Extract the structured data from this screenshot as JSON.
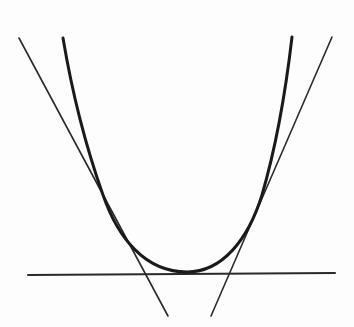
{
  "figure": {
    "description": "Convex curve with three tangent lines: one horizontal tangent at the minimum and one tangent on each side",
    "colors": {
      "background": "#fdfdfd",
      "curve": "#1a1a1a",
      "tangent": "#2a2a2a"
    },
    "curve": {
      "name": "convex-curve",
      "stroke_width": 3,
      "path": "M 63 38 C 70 80, 80 130, 103 195 C 118 238, 145 272, 187 272 C 222 272, 248 240, 262 195 C 278 140, 287 80, 292 37"
    },
    "tangents": [
      {
        "name": "left-tangent-line",
        "x1": 19,
        "y1": 38,
        "x2": 168,
        "y2": 316,
        "stroke_width": 1.6
      },
      {
        "name": "right-tangent-line",
        "x1": 332,
        "y1": 37,
        "x2": 211,
        "y2": 316,
        "stroke_width": 1.6
      },
      {
        "name": "horizontal-tangent-line",
        "x1": 28,
        "y1": 275,
        "x2": 335,
        "y2": 273,
        "stroke_width": 2
      }
    ]
  }
}
